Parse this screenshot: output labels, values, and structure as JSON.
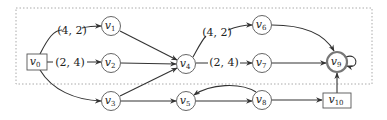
{
  "diagram": {
    "type": "directed-graph",
    "frame": {
      "style": "dotted",
      "color": "#aaaaaa",
      "x": 16,
      "y": 8,
      "w": 356,
      "h": 76
    },
    "nodes": [
      {
        "id": "v0",
        "label": "v",
        "sub": "0",
        "shape": "rect",
        "x": 37,
        "y": 62
      },
      {
        "id": "v1",
        "label": "v",
        "sub": "1",
        "shape": "circle",
        "x": 111,
        "y": 26
      },
      {
        "id": "v2",
        "label": "v",
        "sub": "2",
        "shape": "circle",
        "x": 111,
        "y": 63
      },
      {
        "id": "v3",
        "label": "v",
        "sub": "3",
        "shape": "circle",
        "x": 111,
        "y": 101
      },
      {
        "id": "v4",
        "label": "v",
        "sub": "4",
        "shape": "circle",
        "x": 186,
        "y": 64
      },
      {
        "id": "v5",
        "label": "v",
        "sub": "5",
        "shape": "circle",
        "x": 186,
        "y": 101
      },
      {
        "id": "v6",
        "label": "v",
        "sub": "6",
        "shape": "circle",
        "x": 262,
        "y": 25
      },
      {
        "id": "v7",
        "label": "v",
        "sub": "7",
        "shape": "circle",
        "x": 262,
        "y": 63
      },
      {
        "id": "v8",
        "label": "v",
        "sub": "8",
        "shape": "circle",
        "x": 262,
        "y": 100
      },
      {
        "id": "v9",
        "label": "v",
        "sub": "9",
        "shape": "double-circle",
        "x": 337,
        "y": 62
      },
      {
        "id": "v10",
        "label": "v",
        "sub": "10",
        "shape": "rect",
        "x": 337,
        "y": 100
      }
    ],
    "edges": [
      {
        "from": "v0",
        "to": "v1",
        "label": "(4, 2)"
      },
      {
        "from": "v0",
        "to": "v2",
        "label": "(2, 4)"
      },
      {
        "from": "v0",
        "to": "v3",
        "label": ""
      },
      {
        "from": "v1",
        "to": "v4",
        "label": ""
      },
      {
        "from": "v2",
        "to": "v4",
        "label": ""
      },
      {
        "from": "v3",
        "to": "v4",
        "label": ""
      },
      {
        "from": "v3",
        "to": "v5",
        "label": ""
      },
      {
        "from": "v4",
        "to": "v6",
        "label": "(4, 2)"
      },
      {
        "from": "v4",
        "to": "v7",
        "label": "(2, 4)"
      },
      {
        "from": "v5",
        "to": "v8",
        "label": ""
      },
      {
        "from": "v8",
        "to": "v5",
        "label": ""
      },
      {
        "from": "v6",
        "to": "v9",
        "label": ""
      },
      {
        "from": "v7",
        "to": "v9",
        "label": ""
      },
      {
        "from": "v8",
        "to": "v10",
        "label": ""
      },
      {
        "from": "v10",
        "to": "v9",
        "label": ""
      },
      {
        "from": "v9",
        "to": "v9",
        "label": ""
      }
    ],
    "edge_labels": {
      "v0_v1": "(4, 2)",
      "v0_v2": "(2, 4)",
      "v4_v6": "(4, 2)",
      "v4_v7": "(2, 4)"
    }
  }
}
